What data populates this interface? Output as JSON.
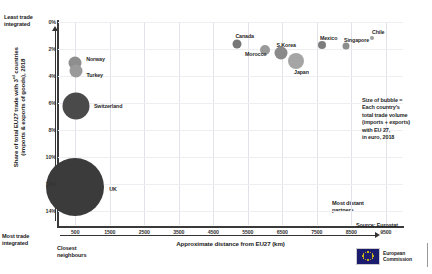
{
  "chart_data": {
    "type": "scatter",
    "title": "",
    "xlabel": "Approximate distance from EU27 (km)",
    "ylabel_line1": "Share of total EU27 trade with 3",
    "ylabel_sup": "rd",
    "ylabel_line2": " countries",
    "ylabel_line3": "(imports & exports of goods), 2018",
    "xlim": [
      0,
      10000
    ],
    "ylim": [
      0,
      15
    ],
    "xticks": [
      "500",
      "1500",
      "2500",
      "3500",
      "4500",
      "5500",
      "6500",
      "7500",
      "8500",
      "9500"
    ],
    "xtick_values": [
      500,
      1500,
      2500,
      3500,
      4500,
      5500,
      6500,
      7500,
      8500,
      9500
    ],
    "yticks": [
      "0%",
      "2%",
      "4%",
      "6%",
      "8%",
      "10%",
      "12%",
      "14%"
    ],
    "ytick_values": [
      0,
      2,
      4,
      6,
      8,
      10,
      12,
      14
    ],
    "grid": true,
    "legend": "none",
    "bubble_meaning": "Size of bubble = total trade volume (imports + exports) with EU 27, in euro, 2018",
    "points": [
      {
        "name": "UK",
        "x": 500,
        "y": 12.2,
        "size": 58,
        "label_dx": 34,
        "label_dy": 2,
        "color": "#3b3b3b"
      },
      {
        "name": "Switzerland",
        "x": 520,
        "y": 6.2,
        "size": 27,
        "label_dx": 18,
        "label_dy": 0,
        "color": "#4a4a4a"
      },
      {
        "name": "Norway",
        "x": 500,
        "y": 3.0,
        "size": 13,
        "label_dx": 11,
        "label_dy": -4,
        "color": "#8e8e8e"
      },
      {
        "name": "Turkey",
        "x": 510,
        "y": 3.6,
        "size": 13,
        "label_dx": 11,
        "label_dy": 4,
        "color": "#9a9a9a"
      },
      {
        "name": "Canada",
        "x": 5200,
        "y": 1.6,
        "size": 9,
        "label_dx": -2,
        "label_dy": -8,
        "color": "#777777"
      },
      {
        "name": "Morocco",
        "x": 6000,
        "y": 2.1,
        "size": 10,
        "label_dx": -20,
        "label_dy": 4,
        "color": "#9a9a9a"
      },
      {
        "name": "S.Korea",
        "x": 6450,
        "y": 2.3,
        "size": 13,
        "label_dx": -4,
        "label_dy": -8,
        "color": "#8a8a8a"
      },
      {
        "name": "Japan",
        "x": 6900,
        "y": 2.9,
        "size": 16,
        "label_dx": -2,
        "label_dy": 11,
        "color": "#a5a5a5"
      },
      {
        "name": "Mexico",
        "x": 7650,
        "y": 1.7,
        "size": 8,
        "label_dx": -2,
        "label_dy": -7,
        "color": "#7d7d7d"
      },
      {
        "name": "Singapore",
        "x": 8350,
        "y": 1.8,
        "size": 7,
        "label_dx": -2,
        "label_dy": -6,
        "color": "#8d8d8d"
      },
      {
        "name": "Chile",
        "x": 9100,
        "y": 1.2,
        "size": 4,
        "label_dx": 0,
        "label_dy": -6,
        "color": "#9e9e9e"
      }
    ],
    "annotations": {
      "least_integrated": "Least trade\nintegrated",
      "most_integrated": "Most trade\nintegrated",
      "closest": "Closest\nneighbours",
      "most_distant": "Most distant\npartners"
    }
  },
  "note": {
    "line1": "Size of bubble =",
    "line2": "Each country's",
    "line3": "total trade volume",
    "line4": "(imports + exports)",
    "line5": "with EU 27,",
    "line6": "in euro, 2018"
  },
  "source": {
    "text": "Source: Eurostat"
  },
  "logo": {
    "line1": "European",
    "line2": "Commission"
  },
  "colors": {
    "axis": "#3a3a3a",
    "grid": "#e2e2e8",
    "text": "#222222",
    "flag": "#1c1c6e"
  }
}
